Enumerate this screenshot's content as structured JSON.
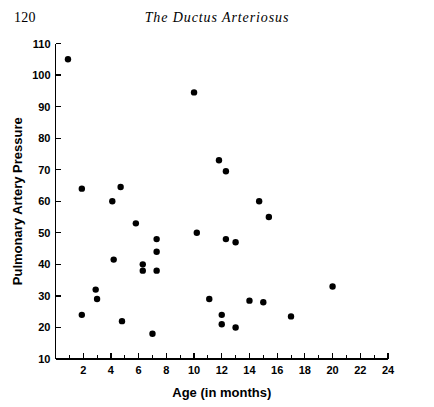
{
  "page": {
    "number": "120",
    "running_title": "The Ductus Arteriosus"
  },
  "chart_data": {
    "type": "scatter",
    "title": "",
    "xlabel": "Age (in months)",
    "ylabel": "Pulmonary Artery Pressure",
    "xlim": [
      0,
      24
    ],
    "ylim": [
      10,
      110
    ],
    "xticks": [
      2,
      4,
      6,
      8,
      10,
      12,
      14,
      16,
      18,
      20,
      22,
      24
    ],
    "xtick_labels": [
      "2",
      "4",
      "6",
      "8",
      "10",
      "12",
      "14",
      "16",
      "18",
      "20",
      "22",
      "24"
    ],
    "x_minor_tick_step": 1,
    "yticks": [
      10,
      20,
      30,
      40,
      50,
      60,
      70,
      80,
      90,
      100,
      110
    ],
    "ytick_labels": [
      "10",
      "20",
      "30",
      "40",
      "50",
      "60",
      "70",
      "80",
      "90",
      "100",
      "110"
    ],
    "grid": false,
    "legend": null,
    "marker": "filled-circle",
    "marker_color": "#000000",
    "marker_size_px": 4.2,
    "points": [
      {
        "x": 0.9,
        "y": 105
      },
      {
        "x": 1.9,
        "y": 64
      },
      {
        "x": 1.9,
        "y": 24
      },
      {
        "x": 2.9,
        "y": 32
      },
      {
        "x": 3.0,
        "y": 29
      },
      {
        "x": 4.1,
        "y": 60
      },
      {
        "x": 4.2,
        "y": 41.5
      },
      {
        "x": 4.7,
        "y": 64.5
      },
      {
        "x": 4.8,
        "y": 22
      },
      {
        "x": 5.8,
        "y": 53
      },
      {
        "x": 6.3,
        "y": 40
      },
      {
        "x": 6.3,
        "y": 38
      },
      {
        "x": 7.0,
        "y": 18
      },
      {
        "x": 7.3,
        "y": 48
      },
      {
        "x": 7.3,
        "y": 44
      },
      {
        "x": 7.3,
        "y": 38
      },
      {
        "x": 10.0,
        "y": 94.5
      },
      {
        "x": 10.2,
        "y": 50
      },
      {
        "x": 11.1,
        "y": 29
      },
      {
        "x": 11.8,
        "y": 73
      },
      {
        "x": 12.0,
        "y": 24
      },
      {
        "x": 12.0,
        "y": 21
      },
      {
        "x": 12.3,
        "y": 69.5
      },
      {
        "x": 12.3,
        "y": 48
      },
      {
        "x": 13.0,
        "y": 47
      },
      {
        "x": 13.0,
        "y": 20
      },
      {
        "x": 14.0,
        "y": 28.5
      },
      {
        "x": 14.7,
        "y": 60
      },
      {
        "x": 15.4,
        "y": 55
      },
      {
        "x": 15.0,
        "y": 28
      },
      {
        "x": 17.0,
        "y": 23.5
      },
      {
        "x": 20.0,
        "y": 33
      }
    ]
  }
}
